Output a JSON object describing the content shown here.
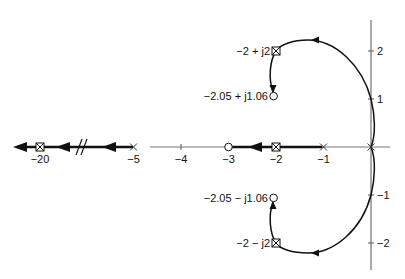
{
  "diagram": {
    "type": "root-locus",
    "real_axis_ticks": [
      {
        "value": -20,
        "label": "−20"
      },
      {
        "value": -5,
        "label": "−5"
      },
      {
        "value": -4,
        "label": "−4"
      },
      {
        "value": -3,
        "label": "−3"
      },
      {
        "value": -2,
        "label": "−2"
      },
      {
        "value": -1,
        "label": "−1"
      }
    ],
    "imag_axis_ticks": [
      {
        "value": 2,
        "label": "2"
      },
      {
        "value": 1,
        "label": "1"
      },
      {
        "value": -1,
        "label": "−1"
      },
      {
        "value": -2,
        "label": "−2"
      }
    ],
    "poles": [
      {
        "re": 0,
        "im": 0,
        "symbol": "x"
      },
      {
        "re": -1,
        "im": 0,
        "symbol": "x"
      },
      {
        "re": -5,
        "im": 0,
        "symbol": "x"
      },
      {
        "re": -2,
        "im": 0,
        "symbol": "boxed-x"
      },
      {
        "re": -20,
        "im": 0,
        "symbol": "boxed-x"
      },
      {
        "re": -2,
        "im": 2,
        "symbol": "boxed-x",
        "label": "−2 + j2"
      },
      {
        "re": -2,
        "im": -2,
        "symbol": "boxed-x",
        "label": "−2 − j2"
      }
    ],
    "zeros": [
      {
        "re": -3,
        "im": 0
      },
      {
        "re": -2.05,
        "im": 1.06,
        "label": "−2.05 + j1.06"
      },
      {
        "re": -2.05,
        "im": -1.06,
        "label": "−2.05 − j1.06"
      }
    ],
    "axis_break_symbol": "//"
  }
}
